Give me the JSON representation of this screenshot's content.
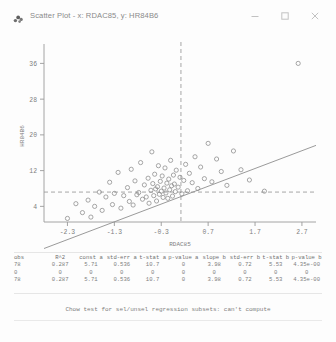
{
  "window": {
    "title": "Scatter Plot - x: RDAC85, y: HR84B6",
    "app_icon": "scatter-plot-icon",
    "controls": {
      "minimize": "–",
      "maximize": "□",
      "close": "✕"
    }
  },
  "chart_data": {
    "type": "scatter",
    "title": "",
    "xlabel": "RDAC85",
    "ylabel": "HR84B6",
    "xlim": [
      -2.8,
      3.0
    ],
    "ylim": [
      0.5,
      39.0
    ],
    "xticks": [
      -2.3,
      -1.3,
      -0.3,
      0.7,
      1.7,
      2.7
    ],
    "xticklabels": [
      "-2.3",
      "-1.3",
      "-0.3",
      "0.7",
      "1.7",
      "2.7"
    ],
    "yticks": [
      4,
      12,
      20,
      28,
      36
    ],
    "yticklabels": [
      "4",
      "12",
      "20",
      "28",
      "36"
    ],
    "grid": false,
    "legend": null,
    "marker": "open-circle",
    "reference_lines": {
      "vertical_x": 0.12,
      "horizontal_y": 7.2,
      "style": "dashed"
    },
    "regression_line": {
      "slope": 3.98,
      "intercept": 5.71,
      "style": "solid",
      "x_from": -2.8,
      "x_to": 3.0
    },
    "points": [
      [
        -2.3,
        1.3
      ],
      [
        -2.12,
        4.6
      ],
      [
        -1.98,
        2.6
      ],
      [
        -1.86,
        5.4
      ],
      [
        -1.8,
        1.6
      ],
      [
        -1.72,
        4.0
      ],
      [
        -1.62,
        7.2
      ],
      [
        -1.56,
        3.1
      ],
      [
        -1.48,
        6.1
      ],
      [
        -1.4,
        9.4
      ],
      [
        -1.34,
        4.4
      ],
      [
        -1.3,
        6.9
      ],
      [
        -1.22,
        11.6
      ],
      [
        -1.16,
        3.6
      ],
      [
        -1.1,
        6.4
      ],
      [
        -1.02,
        8.2
      ],
      [
        -0.98,
        5.1
      ],
      [
        -0.94,
        12.3
      ],
      [
        -0.9,
        4.3
      ],
      [
        -0.86,
        9.7
      ],
      [
        -0.82,
        6.6
      ],
      [
        -0.78,
        7.1
      ],
      [
        -0.74,
        13.8
      ],
      [
        -0.7,
        5.6
      ],
      [
        -0.66,
        8.8
      ],
      [
        -0.62,
        6.1
      ],
      [
        -0.58,
        10.3
      ],
      [
        -0.56,
        4.7
      ],
      [
        -0.52,
        7.6
      ],
      [
        -0.5,
        16.2
      ],
      [
        -0.48,
        9.1
      ],
      [
        -0.46,
        6.4
      ],
      [
        -0.44,
        11.2
      ],
      [
        -0.42,
        7.9
      ],
      [
        -0.4,
        5.2
      ],
      [
        -0.38,
        8.4
      ],
      [
        -0.36,
        13.1
      ],
      [
        -0.34,
        6.7
      ],
      [
        -0.32,
        9.6
      ],
      [
        -0.3,
        7.4
      ],
      [
        -0.28,
        10.8
      ],
      [
        -0.26,
        6.0
      ],
      [
        -0.24,
        8.1
      ],
      [
        -0.22,
        12.6
      ],
      [
        -0.2,
        7.0
      ],
      [
        -0.18,
        9.2
      ],
      [
        -0.16,
        5.8
      ],
      [
        -0.14,
        10.1
      ],
      [
        -0.12,
        7.7
      ],
      [
        -0.1,
        14.3
      ],
      [
        -0.08,
        8.6
      ],
      [
        -0.06,
        6.3
      ],
      [
        -0.04,
        11.0
      ],
      [
        -0.02,
        9.0
      ],
      [
        0.0,
        7.3
      ],
      [
        0.02,
        12.1
      ],
      [
        0.06,
        8.3
      ],
      [
        0.1,
        10.5
      ],
      [
        0.14,
        6.8
      ],
      [
        0.18,
        9.8
      ],
      [
        0.22,
        13.4
      ],
      [
        0.26,
        7.5
      ],
      [
        0.3,
        11.4
      ],
      [
        0.36,
        9.3
      ],
      [
        0.42,
        15.1
      ],
      [
        0.48,
        8.0
      ],
      [
        0.54,
        12.8
      ],
      [
        0.62,
        10.2
      ],
      [
        0.7,
        18.1
      ],
      [
        0.78,
        9.5
      ],
      [
        0.88,
        14.6
      ],
      [
        0.98,
        11.8
      ],
      [
        1.1,
        8.7
      ],
      [
        1.24,
        16.4
      ],
      [
        1.4,
        12.2
      ],
      [
        1.58,
        9.9
      ],
      [
        1.9,
        7.4
      ],
      [
        2.62,
        36.0
      ]
    ]
  },
  "stats_table": {
    "headers": [
      "obs",
      "R^2",
      "const a",
      "std-err a",
      "t-stat a",
      "p-value a",
      "slope b",
      "std-err b",
      "t-stat b",
      "p-value b"
    ],
    "rows": [
      [
        "78",
        "0.287",
        "5.71",
        "0.536",
        "10.7",
        "0",
        "3.98",
        "0.72",
        "5.53",
        "4.35e-00"
      ],
      [
        "0",
        "0",
        "0",
        "0",
        "0",
        "0",
        "0",
        "0",
        "0",
        "0"
      ],
      [
        "78",
        "0.287",
        "5.71",
        "0.536",
        "10.7",
        "0",
        "3.98",
        "0.72",
        "5.53",
        "4.35e-00"
      ]
    ]
  },
  "footer": {
    "chow_message": "Chow test for sel/unsel regression subsets: can't compute"
  },
  "colors": {
    "marker": "#8a8a8a",
    "line": "#8f8f8f",
    "axis": "#9a9a9a",
    "text": "#7d7d7d",
    "background": "#fdfdfd"
  }
}
